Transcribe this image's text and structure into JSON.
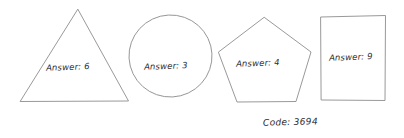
{
  "page": {
    "background_color": "#ffffff",
    "ink_color": "#8d8d8d",
    "text_color": "#2b2b2b"
  },
  "shapes": [
    {
      "name": "triangle",
      "label": "Answer: 6",
      "answer": "6"
    },
    {
      "name": "circle",
      "label": "Answer: 3",
      "answer": "3"
    },
    {
      "name": "pentagon",
      "label": "Answer: 4",
      "answer": "4"
    },
    {
      "name": "rectangle",
      "label": "Answer: 9",
      "answer": "9"
    }
  ],
  "footer": {
    "code_text": "Code: 3694",
    "code_value": "3694"
  }
}
